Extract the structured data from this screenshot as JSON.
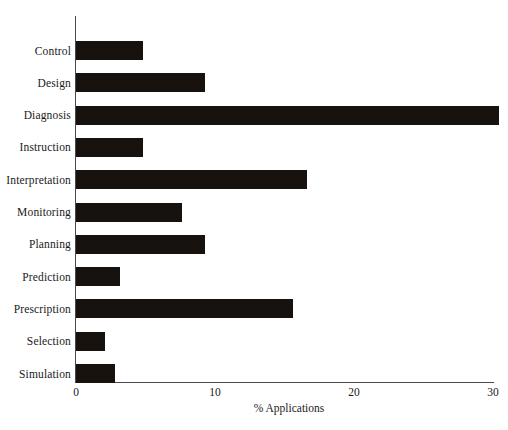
{
  "chart_data": {
    "type": "bar",
    "orientation": "horizontal",
    "title": "",
    "xlabel": "% Applications",
    "ylabel": "",
    "xlim": [
      0,
      30
    ],
    "xticks": [
      0,
      10,
      20,
      30
    ],
    "xticklabels": [
      "0",
      "10",
      "20",
      "30"
    ],
    "grid": false,
    "legend": false,
    "bar_color": "#17120e",
    "axis_color": "#4a4a4a",
    "background": "#ffffff",
    "categories": [
      "Control",
      "Design",
      "Diagnosis",
      "Instruction",
      "Interpretation",
      "Monitoring",
      "Planning",
      "Prediction",
      "Prescription",
      "Selection",
      "Simulation"
    ],
    "values": [
      4.8,
      9.3,
      30.4,
      4.8,
      16.6,
      7.6,
      9.3,
      3.2,
      15.6,
      2.1,
      2.8
    ]
  }
}
